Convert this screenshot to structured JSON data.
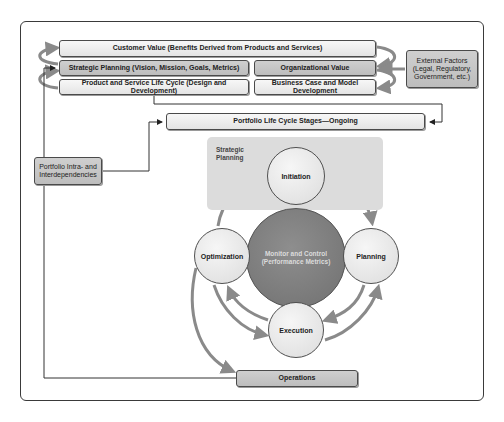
{
  "diagram": {
    "top_rows": {
      "customer_value": "Customer Value (Benefits Derived from Products and Services)",
      "strategic_planning": "Strategic Planning (Vision, Mission, Goals, Metrics)",
      "organizational_value": "Organizational Value",
      "product_service_lifecycle": "Product and Service Life Cycle (Design and Development)",
      "business_case": "Business Case and Model Development"
    },
    "external_factors": {
      "line1": "External Factors",
      "line2": "(Legal, Regulatory,",
      "line3": "Government, etc.)"
    },
    "portfolio_lifecycle": "Portfolio Life Cycle Stages—Ongoing",
    "portfolio_dependencies": {
      "line1": "Portfolio Intra- and",
      "line2": "Interdependencies"
    },
    "strategic_planning_region": {
      "line1": "Strategic",
      "line2": "Planning"
    },
    "cycle": {
      "center": {
        "line1": "Monitor and Control",
        "line2": "(Performance Metrics)"
      },
      "stages": [
        {
          "label": "Initiation"
        },
        {
          "label": "Planning"
        },
        {
          "label": "Execution"
        },
        {
          "label": "Optimization"
        }
      ]
    },
    "operations": "Operations",
    "colors": {
      "light_box": "#ececec",
      "dark_box": "#c6c6c6",
      "monitor_circle": "#7a7a7a",
      "arrow": "#8a8a8a",
      "line": "#3a3a3a"
    }
  }
}
